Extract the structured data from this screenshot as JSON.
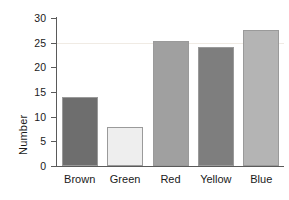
{
  "chart_data": {
    "type": "bar",
    "title": "",
    "xlabel": "",
    "ylabel": "Number",
    "categories": [
      "Brown",
      "Green",
      "Red",
      "Yellow",
      "Blue"
    ],
    "values": [
      14,
      8,
      25.4,
      24.2,
      27.6
    ],
    "ylim": [
      0,
      30
    ],
    "yticks": [
      0,
      5,
      10,
      15,
      20,
      25,
      30
    ],
    "ytick_labels": [
      "0",
      "5",
      "10",
      "15",
      "20",
      "25",
      "30"
    ],
    "grid": false,
    "legend": "none",
    "bar_colors": [
      "#6e6e6e",
      "#eeeeee",
      "#a0a0a0",
      "#7e7e7e",
      "#b4b4b4"
    ],
    "bar_edge_color": "#9a9a9a",
    "axis_color": "#5a5a5a",
    "background": "#ffffff",
    "reference_line_value": 25,
    "reference_line_color": "#f0ebe4"
  }
}
